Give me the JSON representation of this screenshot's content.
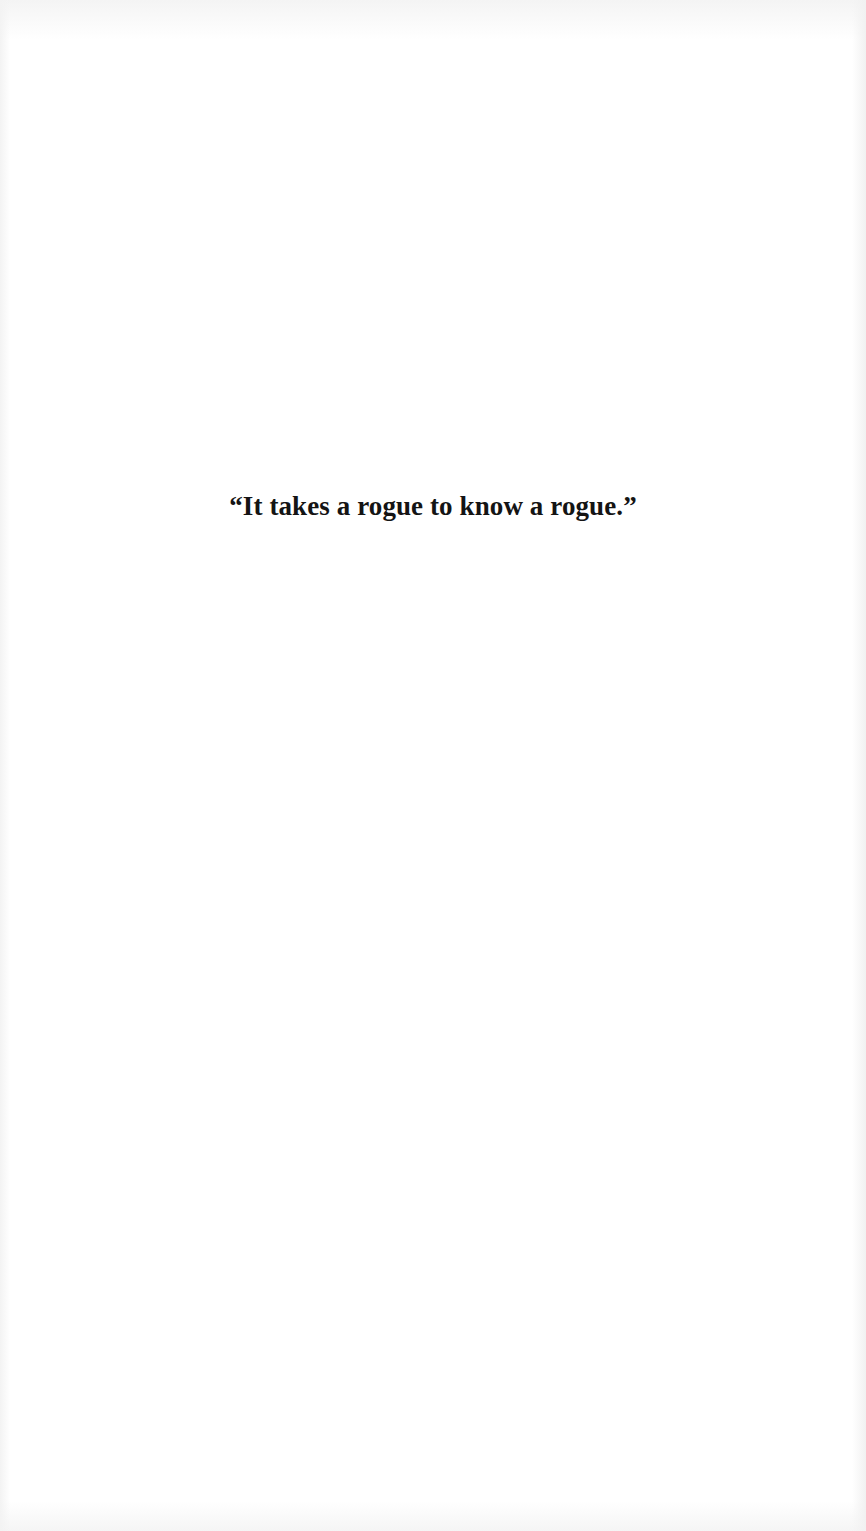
{
  "page": {
    "background_color": "#ffffff",
    "text_color": "#141414"
  },
  "epigraph": {
    "text": "“It takes a rogue to know a rogue.”"
  }
}
